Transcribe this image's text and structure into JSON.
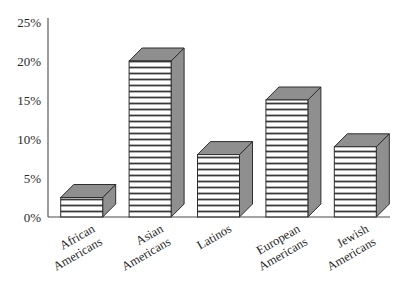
{
  "chart_data": {
    "type": "bar",
    "title": "",
    "subtitle": "",
    "xlabel": "",
    "ylabel": "",
    "categories": [
      "African Americans",
      "Asian Americans",
      "Latinos",
      "European Americans",
      "Jewish Americans"
    ],
    "category_lines": [
      [
        "African",
        "Americans"
      ],
      [
        "Asian",
        "Americans"
      ],
      [
        "Latinos"
      ],
      [
        "European",
        "Americans"
      ],
      [
        "Jewish",
        "Americans"
      ]
    ],
    "values": [
      2.5,
      20,
      8,
      15,
      9
    ],
    "value_labels": [
      "2.5%",
      "20%",
      "8%",
      "15%",
      "9%"
    ],
    "ylim": [
      0,
      25
    ],
    "yticks": [
      0,
      5,
      10,
      15,
      20,
      25
    ],
    "ytick_labels": [
      "0%",
      "5%",
      "10%",
      "15%",
      "20%",
      "25%"
    ],
    "grid": false,
    "legend": "none",
    "style": "3d-bar",
    "label_rotation_deg": -30,
    "colors": {
      "bar_front": "#ffffff",
      "bar_hatch": "#3a3a3a",
      "bar_side": "#8f8f8f",
      "bar_top": "#8f8f8f",
      "bar_outline": "#2e2e2e",
      "axis": "#4a4a4a",
      "text": "#1f1f1f",
      "background": "#ffffff"
    }
  },
  "axis": {
    "y_axis_name": "percent-axis",
    "x_axis_name": "ethnic-group-axis"
  }
}
